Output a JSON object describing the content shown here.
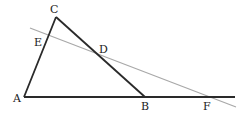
{
  "diagram": {
    "type": "geometry-triangle-with-transversal",
    "colors": {
      "triangle": "#2a2a2a",
      "transversal": "#a8a8a8",
      "labels": "#222222",
      "background": "#ffffff"
    },
    "points": {
      "A": {
        "label": "A",
        "x": 24,
        "y": 97
      },
      "B": {
        "label": "B",
        "x": 145,
        "y": 97
      },
      "C": {
        "label": "C",
        "x": 56,
        "y": 17
      },
      "D": {
        "label": "D",
        "x": 99,
        "y": 60
      },
      "E": {
        "label": "E",
        "x": 47,
        "y": 42
      },
      "F": {
        "label": "F",
        "x": 208,
        "y": 97
      }
    },
    "segments": [
      {
        "from": "A",
        "to": "C",
        "style": "solid-dark"
      },
      {
        "from": "C",
        "to": "B",
        "style": "solid-dark"
      },
      {
        "from": "A",
        "to": "extended past F",
        "style": "solid-dark"
      },
      {
        "from": "through E, D, F",
        "to": "",
        "style": "solid-light-gray"
      }
    ],
    "labels": {
      "A": "A",
      "B": "B",
      "C": "C",
      "D": "D",
      "E": "E",
      "F": "F"
    }
  }
}
